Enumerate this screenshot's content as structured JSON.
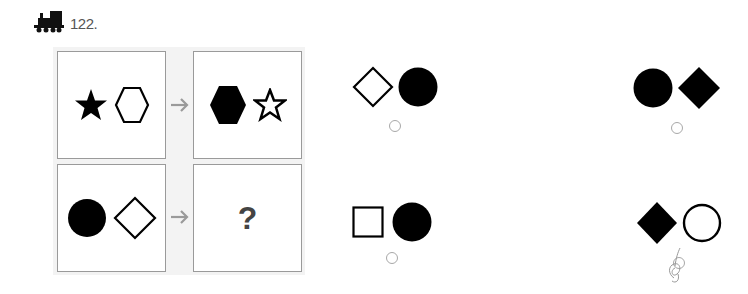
{
  "question": {
    "number_label": "122.",
    "icon": "train-icon"
  },
  "puzzle": {
    "rows": [
      {
        "left": [
          {
            "shape": "star",
            "fill": "filled"
          },
          {
            "shape": "hexagon",
            "fill": "outline"
          }
        ],
        "arrow": "arrow-right-icon",
        "right": [
          {
            "shape": "hexagon",
            "fill": "filled"
          },
          {
            "shape": "star",
            "fill": "outline"
          }
        ]
      },
      {
        "left": [
          {
            "shape": "circle",
            "fill": "filled"
          },
          {
            "shape": "diamond",
            "fill": "outline"
          }
        ],
        "arrow": "arrow-right-icon",
        "right_label": "?"
      }
    ]
  },
  "options": [
    {
      "position": "top-left",
      "shapes": [
        {
          "shape": "diamond",
          "fill": "outline"
        },
        {
          "shape": "circle",
          "fill": "filled"
        }
      ],
      "selected": false
    },
    {
      "position": "top-right",
      "shapes": [
        {
          "shape": "circle",
          "fill": "filled"
        },
        {
          "shape": "diamond",
          "fill": "filled"
        }
      ],
      "selected": false
    },
    {
      "position": "bottom-left",
      "shapes": [
        {
          "shape": "square",
          "fill": "outline"
        },
        {
          "shape": "circle",
          "fill": "filled"
        }
      ],
      "selected": false
    },
    {
      "position": "bottom-right",
      "shapes": [
        {
          "shape": "diamond",
          "fill": "filled"
        },
        {
          "shape": "circle",
          "fill": "outline"
        }
      ],
      "selected": true,
      "mark": "pencil-scribble"
    }
  ],
  "colors": {
    "shape": "#000000",
    "border": "#9a9a9a",
    "panel_bg": "#f3f3f3",
    "arrow": "#9a9a9a",
    "radio": "#a8a8a8"
  }
}
